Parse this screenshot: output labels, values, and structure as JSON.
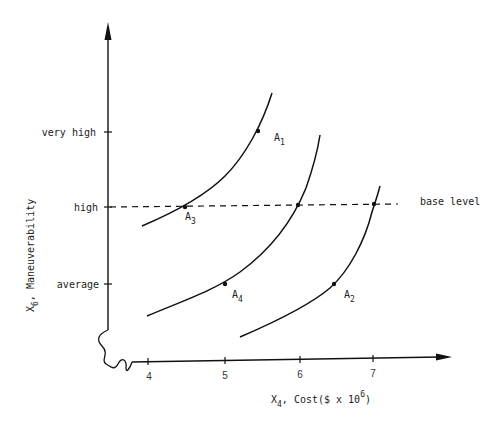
{
  "diagram": {
    "y_axis": {
      "label": "X",
      "label_sub": "6",
      "label_rest": ", Maneuverability",
      "ticks": [
        {
          "label": "very high",
          "y": 132
        },
        {
          "label": "high",
          "y": 207
        },
        {
          "label": "average",
          "y": 284
        }
      ]
    },
    "x_axis": {
      "label": "X",
      "label_sub": "4",
      "label_rest": ", Cost($ x 10",
      "label_sup": "6",
      "label_end": ")",
      "ticks": [
        {
          "label": "4",
          "x": 148
        },
        {
          "label": "5",
          "x": 225
        },
        {
          "label": "6",
          "x": 300
        },
        {
          "label": "7",
          "x": 373
        }
      ]
    },
    "base_level_label": "base level",
    "points": [
      {
        "name": "A",
        "sub": "1",
        "x": 258,
        "y": 131
      },
      {
        "name": "A",
        "sub": "2",
        "x": 334,
        "y": 284
      },
      {
        "name": "A",
        "sub": "3",
        "x": 185,
        "y": 207
      },
      {
        "name": "A",
        "sub": "4",
        "x": 225,
        "y": 284
      }
    ],
    "colors": {
      "line": "#111111",
      "text": "#222222",
      "background": "#ffffff"
    }
  }
}
